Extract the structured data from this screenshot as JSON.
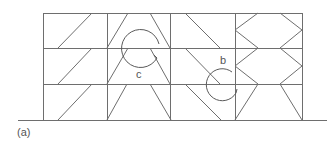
{
  "figure": {
    "caption": "(a)",
    "labels": {
      "c": "c",
      "b": "b"
    },
    "colors": {
      "line": "#6e6e6e",
      "text": "#555555",
      "background": "#ffffff"
    },
    "frame": {
      "storeys": 3,
      "bays": 4,
      "columns_x": [
        43,
        107,
        170,
        235,
        302
      ],
      "floors_y": [
        13,
        48,
        84,
        120
      ],
      "ground": {
        "x1": 18,
        "x2": 327,
        "y": 120
      }
    },
    "bracing": {
      "bay1": "single diagonal per storey (rising to the right)",
      "bay2": "inverted-V / splayed pair per storey",
      "bay3": "single diagonal per storey (falling to the right)",
      "bay4": "chevron (K-type) bracing on both columns"
    },
    "rotation_markers": [
      {
        "label": "c",
        "cx": 140,
        "cy": 49,
        "r": 19
      },
      {
        "label": "b",
        "cx": 222,
        "cy": 85,
        "r": 16
      }
    ]
  }
}
